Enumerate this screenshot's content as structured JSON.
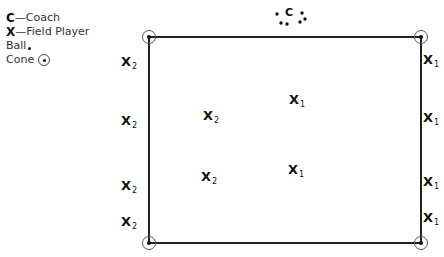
{
  "legend": {
    "coach": {
      "symbol": "C",
      "label": "—Coach"
    },
    "field_player": {
      "symbol": "X",
      "label": "—Field Player"
    },
    "ball": {
      "label": "Ball",
      "icon": "ball-dot"
    },
    "cone": {
      "label": "Cone",
      "icon": "cone-circle-dot"
    }
  },
  "coach": {
    "symbol": "C",
    "balls": 5
  },
  "field": {
    "corners": [
      [
        149,
        37
      ],
      [
        421,
        37
      ],
      [
        149,
        243
      ],
      [
        421,
        243
      ]
    ],
    "line_color": "#222222"
  },
  "players": {
    "left_side": [
      {
        "symbol": "X",
        "sub": "2",
        "x": 125,
        "y": 62
      },
      {
        "symbol": "X",
        "sub": "2",
        "x": 125,
        "y": 121
      },
      {
        "symbol": "X",
        "sub": "2",
        "x": 125,
        "y": 186
      },
      {
        "symbol": "X",
        "sub": "2",
        "x": 125,
        "y": 222
      }
    ],
    "inner_team2": [
      {
        "symbol": "X",
        "sub": "2",
        "x": 207,
        "y": 116
      },
      {
        "symbol": "X",
        "sub": "2",
        "x": 205,
        "y": 177
      }
    ],
    "inner_team1": [
      {
        "symbol": "X",
        "sub": "1",
        "x": 293,
        "y": 100
      },
      {
        "symbol": "X",
        "sub": "1",
        "x": 292,
        "y": 170
      }
    ],
    "right_side": [
      {
        "symbol": "X",
        "sub": "1",
        "x": 427,
        "y": 60
      },
      {
        "symbol": "X",
        "sub": "1",
        "x": 427,
        "y": 118
      },
      {
        "symbol": "X",
        "sub": "1",
        "x": 427,
        "y": 182
      },
      {
        "symbol": "X",
        "sub": "1",
        "x": 427,
        "y": 218
      }
    ]
  }
}
